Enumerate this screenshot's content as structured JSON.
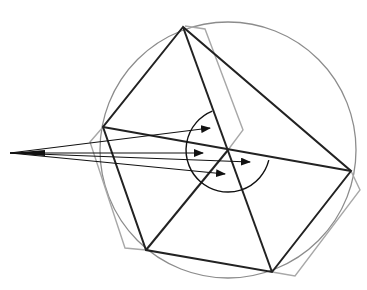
{
  "diagram": {
    "colors": {
      "background": "#ffffff",
      "pentagon": "#222222",
      "gray_outline": "#a8a8a8",
      "circle": "#8c8c8c",
      "arrows": "#111111"
    },
    "circle": {
      "cx": 228,
      "cy": 150,
      "r": 128
    },
    "pentagon_vertices": [
      [
        183,
        27
      ],
      [
        103,
        127
      ],
      [
        146,
        250
      ],
      [
        272,
        272
      ],
      [
        351,
        171
      ]
    ],
    "diagonals": [
      [
        [
          183,
          27
        ],
        [
          272,
          272
        ]
      ],
      [
        [
          103,
          127
        ],
        [
          351,
          171
        ]
      ],
      [
        [
          146,
          250
        ],
        [
          228,
          150
        ]
      ]
    ],
    "gray_polygon_points": "185,26 205,29 243,130 228,150 272,272 295,276 360,190 351,171 103,127 90,142 125,248 146,250",
    "arc": {
      "cx": 228,
      "cy": 150,
      "r": 42
    },
    "arrow_source": [
      10,
      153
    ],
    "arrow_targets": [
      [
        210,
        128
      ],
      [
        203,
        153
      ],
      [
        250,
        162
      ],
      [
        225,
        174
      ]
    ]
  }
}
